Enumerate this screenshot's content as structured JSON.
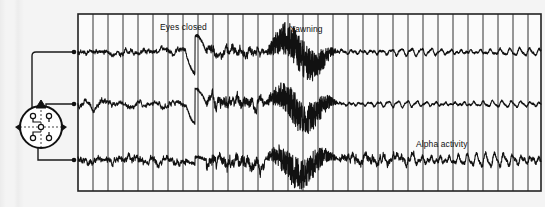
{
  "figure": {
    "name": "eeg-recording-figure",
    "background_color": "#f4f4f4",
    "trace_color": "#111111",
    "grid_color": "#3a3a3a"
  },
  "head_diagram": {
    "name": "scalp-electrode-placement-diagram",
    "description": "top view of head with electrode positions",
    "nose_marker": "nose-triangle",
    "ear_markers": [
      "left-ear-marker",
      "right-ear-marker"
    ],
    "electrode_count": 5,
    "lead_count": 3
  },
  "annotations": [
    {
      "id": "eyes-closed",
      "label": "Eyes closed",
      "x": 160,
      "y": 22
    },
    {
      "id": "yawning",
      "label": "Yawning",
      "x": 290,
      "y": 24
    },
    {
      "id": "alpha-activity",
      "label": "Alpha activity",
      "x": 416,
      "y": 139
    }
  ],
  "chart_data": {
    "type": "line",
    "title": "",
    "subtitle": "",
    "xlabel": "",
    "ylabel": "",
    "grid": true,
    "legend_position": "none",
    "x": [
      0,
      31
    ],
    "axis": {
      "plot_left_px": 78,
      "plot_right_px": 541,
      "plot_top_px": 14,
      "plot_bottom_px": 191,
      "vertical_gridlines": 31,
      "gridline_spacing_px": 15,
      "horizontal_gridlines": 0
    },
    "series": [
      {
        "name": "channel-1",
        "label": "Channel 1 (frontal lead)",
        "baseline_y_px": 52,
        "segments": [
          {
            "from_x": 0,
            "to_x": 7.2,
            "state": "awake low-amplitude",
            "amplitude": 4
          },
          {
            "from_x": 7.2,
            "to_x": 8.6,
            "state": "eye-blink artifact (eyes closed)",
            "amplitude": 22
          },
          {
            "from_x": 8.6,
            "to_x": 12.5,
            "state": "post-closure mixed",
            "amplitude": 7
          },
          {
            "from_x": 12.5,
            "to_x": 17.5,
            "state": "yawning artifact",
            "amplitude": 30
          },
          {
            "from_x": 17.5,
            "to_x": 31,
            "state": "alpha rhythm",
            "amplitude": 6
          }
        ]
      },
      {
        "name": "channel-2",
        "label": "Channel 2 (central lead)",
        "baseline_y_px": 104,
        "segments": [
          {
            "from_x": 0,
            "to_x": 7.2,
            "state": "awake low-amplitude",
            "amplitude": 4
          },
          {
            "from_x": 7.2,
            "to_x": 8.6,
            "state": "eye-blink artifact (eyes closed)",
            "amplitude": 20
          },
          {
            "from_x": 8.6,
            "to_x": 12.5,
            "state": "post-closure mixed",
            "amplitude": 9
          },
          {
            "from_x": 12.5,
            "to_x": 17.5,
            "state": "yawning artifact",
            "amplitude": 28
          },
          {
            "from_x": 17.5,
            "to_x": 31,
            "state": "alpha rhythm",
            "amplitude": 5
          }
        ]
      },
      {
        "name": "channel-3",
        "label": "Channel 3 (occipital lead)",
        "baseline_y_px": 160,
        "segments": [
          {
            "from_x": 0,
            "to_x": 7.2,
            "state": "awake low-amplitude",
            "amplitude": 5
          },
          {
            "from_x": 7.2,
            "to_x": 8.6,
            "state": "eye-blink artifact (eyes closed)",
            "amplitude": 9
          },
          {
            "from_x": 8.6,
            "to_x": 12.5,
            "state": "post-closure mixed",
            "amplitude": 10
          },
          {
            "from_x": 12.5,
            "to_x": 17.5,
            "state": "yawning artifact",
            "amplitude": 26
          },
          {
            "from_x": 17.5,
            "to_x": 22.5,
            "state": "transition",
            "amplitude": 7
          },
          {
            "from_x": 22.5,
            "to_x": 31,
            "state": "prominent alpha activity",
            "amplitude": 11
          }
        ]
      }
    ]
  }
}
